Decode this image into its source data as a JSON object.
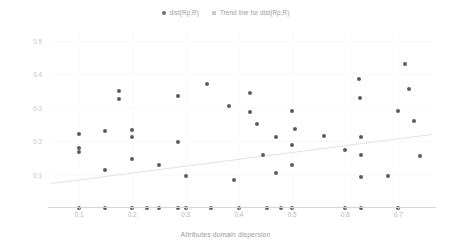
{
  "chart_data": {
    "type": "scatter",
    "title": "",
    "xlabel": "Attributes domain dispersion",
    "ylabel": "dist(Rp,R)",
    "xlim": [
      0.045,
      0.763
    ],
    "ylim": [
      0.0,
      0.53
    ],
    "xticks": [
      "0.1",
      "0.2",
      "0.3",
      "0.4",
      "0.5",
      "0.6",
      "0.7"
    ],
    "xtick_values": [
      0.1,
      0.2,
      0.3,
      0.4,
      0.5,
      0.6,
      0.7
    ],
    "yticks": [
      "0.1",
      "0.2",
      "0.3",
      "0.4",
      "0.5"
    ],
    "ytick_values": [
      0.1,
      0.2,
      0.3,
      0.4,
      0.5
    ],
    "grid": true,
    "legend_position": "top-center",
    "legend": [
      {
        "label": "dist(Rp,R)",
        "marker": "circle",
        "color": "#5b5b68"
      },
      {
        "label": "Trend line for dist(Rp,R)",
        "marker": "square",
        "color": "#c9c9d2"
      }
    ],
    "series": [
      {
        "name": "dist(Rp,R)",
        "marker": "circle",
        "color": "#5b5b68",
        "points": [
          {
            "x": 0.1,
            "y": 0.222
          },
          {
            "x": 0.1,
            "y": 0.18
          },
          {
            "x": 0.1,
            "y": 0.167
          },
          {
            "x": 0.1,
            "y": 0.0
          },
          {
            "x": 0.148,
            "y": 0.232
          },
          {
            "x": 0.148,
            "y": 0.113
          },
          {
            "x": 0.148,
            "y": 0.0
          },
          {
            "x": 0.175,
            "y": 0.35
          },
          {
            "x": 0.175,
            "y": 0.327
          },
          {
            "x": 0.2,
            "y": 0.233
          },
          {
            "x": 0.2,
            "y": 0.213
          },
          {
            "x": 0.2,
            "y": 0.146
          },
          {
            "x": 0.2,
            "y": 0.0
          },
          {
            "x": 0.228,
            "y": 0.0
          },
          {
            "x": 0.25,
            "y": 0.128
          },
          {
            "x": 0.25,
            "y": 0.0
          },
          {
            "x": 0.285,
            "y": 0.335
          },
          {
            "x": 0.285,
            "y": 0.198
          },
          {
            "x": 0.285,
            "y": 0.0
          },
          {
            "x": 0.3,
            "y": 0.095
          },
          {
            "x": 0.3,
            "y": 0.0
          },
          {
            "x": 0.34,
            "y": 0.37
          },
          {
            "x": 0.347,
            "y": 0.0
          },
          {
            "x": 0.382,
            "y": 0.305
          },
          {
            "x": 0.39,
            "y": 0.083
          },
          {
            "x": 0.4,
            "y": 0.0
          },
          {
            "x": 0.42,
            "y": 0.345
          },
          {
            "x": 0.42,
            "y": 0.287
          },
          {
            "x": 0.435,
            "y": 0.252
          },
          {
            "x": 0.445,
            "y": 0.16
          },
          {
            "x": 0.452,
            "y": 0.0
          },
          {
            "x": 0.47,
            "y": 0.213
          },
          {
            "x": 0.47,
            "y": 0.105
          },
          {
            "x": 0.48,
            "y": 0.0
          },
          {
            "x": 0.5,
            "y": 0.29
          },
          {
            "x": 0.5,
            "y": 0.188
          },
          {
            "x": 0.5,
            "y": 0.13
          },
          {
            "x": 0.5,
            "y": 0.0
          },
          {
            "x": 0.505,
            "y": 0.237
          },
          {
            "x": 0.56,
            "y": 0.215
          },
          {
            "x": 0.6,
            "y": 0.175
          },
          {
            "x": 0.6,
            "y": 0.0
          },
          {
            "x": 0.625,
            "y": 0.385
          },
          {
            "x": 0.628,
            "y": 0.33
          },
          {
            "x": 0.63,
            "y": 0.213
          },
          {
            "x": 0.63,
            "y": 0.16
          },
          {
            "x": 0.63,
            "y": 0.092
          },
          {
            "x": 0.63,
            "y": 0.0
          },
          {
            "x": 0.68,
            "y": 0.095
          },
          {
            "x": 0.7,
            "y": 0.29
          },
          {
            "x": 0.7,
            "y": 0.0
          },
          {
            "x": 0.712,
            "y": 0.43
          },
          {
            "x": 0.72,
            "y": 0.355
          },
          {
            "x": 0.73,
            "y": 0.262
          },
          {
            "x": 0.74,
            "y": 0.155
          }
        ]
      }
    ],
    "trendline": {
      "name": "Trend line for dist(Rp,R)",
      "color": "#e2e2e8",
      "x_start": 0.047,
      "y_start": 0.075,
      "x_end": 0.763,
      "y_end": 0.222
    }
  }
}
